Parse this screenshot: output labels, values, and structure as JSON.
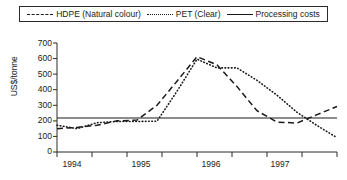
{
  "legend": {
    "position": "top",
    "entries": [
      {
        "label": "HDPE (Natural colour)",
        "style": "dashed",
        "icon": "dashed-line-icon"
      },
      {
        "label": "PET (Clear)",
        "style": "dotted",
        "icon": "dotted-line-icon"
      },
      {
        "label": "Processing costs",
        "style": "solid",
        "icon": "solid-line-icon"
      }
    ]
  },
  "axis": {
    "ylabel": "US$/tonne",
    "yticks": [
      "700",
      "600",
      "500",
      "400",
      "300",
      "200",
      "100",
      "0"
    ],
    "xticks": [
      "1994",
      "1995",
      "1996",
      "1997"
    ]
  },
  "chart_data": {
    "type": "line",
    "title": "",
    "xlabel": "",
    "ylabel": "US$/tonne",
    "ylim": [
      0,
      700
    ],
    "xlim": [
      0,
      14
    ],
    "grid": false,
    "legend_position": "top",
    "x": [
      0,
      1,
      2,
      3,
      4,
      5,
      6,
      7,
      8,
      9,
      10,
      11,
      12,
      13,
      14
    ],
    "x_tick_labels": [
      "1994",
      "1995",
      "1996",
      "1997"
    ],
    "series": [
      {
        "name": "HDPE (Natural colour)",
        "style": "dashed",
        "color": "#1a1a1a",
        "values": [
          150,
          158,
          172,
          200,
          205,
          300,
          455,
          612,
          560,
          420,
          265,
          192,
          186,
          240,
          292
        ]
      },
      {
        "name": "PET (Clear)",
        "style": "dotted",
        "color": "#1a1a1a",
        "values": [
          172,
          150,
          188,
          196,
          196,
          198,
          390,
          596,
          540,
          540,
          460,
          365,
          255,
          170,
          92
        ]
      },
      {
        "name": "Processing costs",
        "style": "solid",
        "color": "#1a1a1a",
        "values": [
          218,
          218,
          218,
          218,
          218,
          218,
          218,
          218,
          218,
          218,
          218,
          218,
          218,
          218,
          218
        ]
      }
    ]
  }
}
